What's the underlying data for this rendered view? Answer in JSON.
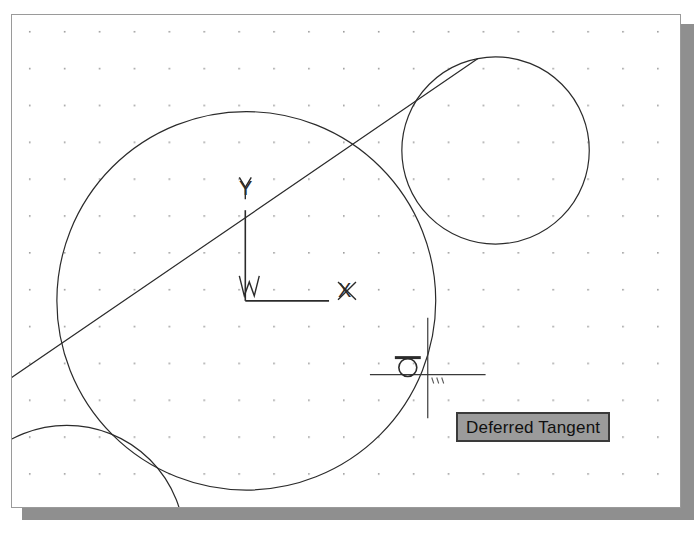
{
  "window": {
    "kind": "cad-drawing-area",
    "background_color": "#ffffff",
    "frame_color": "#9a9a9a",
    "shadow_color": "#8f8f8f",
    "width": 670,
    "height": 494
  },
  "grid": {
    "visible": true,
    "dot_color": "#9a9a9a",
    "spacing_x": 35,
    "spacing_y": 37,
    "origin_x": 17,
    "origin_y": 16
  },
  "ucs_icon": {
    "name": "World Coordinate System icon",
    "y_axis_label": "Y",
    "x_axis_label": "X",
    "world_marker_label": "W",
    "origin_x": 234,
    "origin_y": 287,
    "x_axis_length": 84,
    "y_axis_length": 92,
    "line_color": "#2b2b2b"
  },
  "tooltip": {
    "text": "Deferred Tangent",
    "background_color": "#9b9b9b",
    "border_color": "#3a3a3a",
    "text_color": "#101010",
    "x": 444,
    "y": 397
  },
  "cursor": {
    "type": "crosshair",
    "x": 428,
    "y": 375,
    "horizontal_span": [
      370,
      486
    ],
    "vertical_span": [
      318,
      419
    ],
    "color": "#3a3a3a",
    "snap_marker": {
      "name": "tangent-osnap-marker",
      "type": "tangent",
      "x": 408,
      "y": 368,
      "radius": 9,
      "bar_width": 26,
      "color": "#2b2b2b"
    },
    "badge": "snap-ticks"
  },
  "chart_data": {
    "type": "scatter",
    "title": "",
    "xlabel": "",
    "ylabel": "",
    "grid": true,
    "legend": "none",
    "xlim": [
      0,
      670
    ],
    "ylim": [
      0,
      494
    ],
    "entities": [
      {
        "id": "circle-large",
        "kind": "circle",
        "cx": 235,
        "cy": 287,
        "r": 190,
        "stroke": "#2b2b2b",
        "stroke_width": 1.2,
        "fill": "none",
        "label": "large construction circle"
      },
      {
        "id": "circle-small",
        "kind": "circle",
        "cx": 485,
        "cy": 136,
        "r": 94,
        "stroke": "#2b2b2b",
        "stroke_width": 1.2,
        "fill": "none",
        "label": "small circle upper right"
      },
      {
        "id": "circle-corner",
        "kind": "circle",
        "cx": 55,
        "cy": 530,
        "r": 118,
        "stroke": "#2b2b2b",
        "stroke_width": 1.2,
        "fill": "none",
        "label": "partially visible circle lower left"
      },
      {
        "id": "tangent-line",
        "kind": "line",
        "x1": 467,
        "y1": 44,
        "x2": -12,
        "y2": 372,
        "stroke": "#2b2b2b",
        "stroke_width": 1.2,
        "label": "tangent line from small circle to lower left"
      }
    ]
  }
}
